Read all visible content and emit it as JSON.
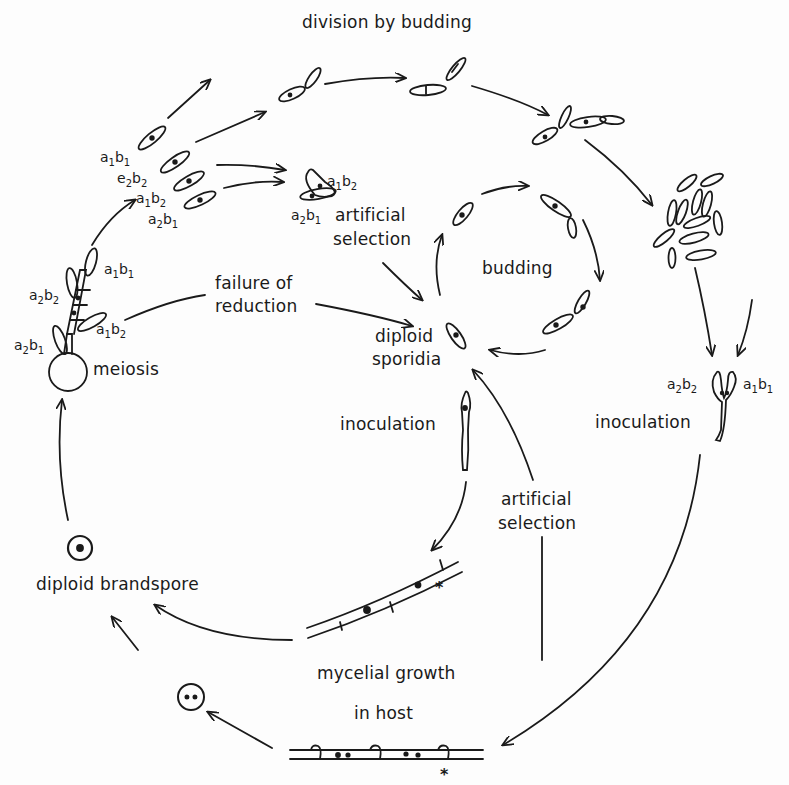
{
  "diagram": {
    "type": "life-cycle",
    "colors": {
      "ink": "#1a1a1a",
      "paper": "#fdfdfd"
    },
    "labels": {
      "division_by_budding": "division by budding",
      "artificial_selection_top_1": "artificial",
      "artificial_selection_top_2": "selection",
      "budding": "budding",
      "failure_of_reduction_1": "failure of",
      "failure_of_reduction_2": "reduction",
      "diploid_sporidia_1": "diploid",
      "diploid_sporidia_2": "sporidia",
      "meiosis": "meiosis",
      "inoculation_center": "inoculation",
      "inoculation_right": "inoculation",
      "artificial_selection_bottom_1": "artificial",
      "artificial_selection_bottom_2": "selection",
      "diploid_brandspore": "diploid brandspore",
      "mycelial_growth_1": "mycelial growth",
      "mycelial_growth_2": "in host",
      "asterisk": "*"
    },
    "genotypes": {
      "a1b1": {
        "a": "a",
        "i": "1",
        "b": "b",
        "j": "1"
      },
      "a2b2": {
        "a": "a",
        "i": "2",
        "b": "b",
        "j": "2"
      },
      "a1b2": {
        "a": "a",
        "i": "1",
        "b": "b",
        "j": "2"
      },
      "a2b1": {
        "a": "a",
        "i": "2",
        "b": "b",
        "j": "1"
      },
      "e2b2": {
        "a": "e",
        "i": "2",
        "b": "b",
        "j": "2"
      }
    },
    "stages": [
      "meiosis",
      "haploid sporidia (a1b1, a2b2, a1b2, a2b1)",
      "division by budding",
      "inoculation (a2b2 + a1b1)",
      "mycelial growth in host",
      "diploid brandspore",
      "failure of reduction",
      "diploid sporidia",
      "budding",
      "inoculation",
      "artificial selection"
    ]
  }
}
